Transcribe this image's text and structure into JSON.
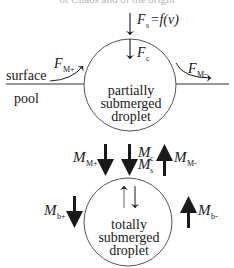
{
  "header": {
    "clipped_caption": "of Chaos and of the origin"
  },
  "top_region": {
    "surface_label": "surface",
    "pool_label": "pool",
    "droplet_label_lines": [
      "partially",
      "submerged",
      "droplet"
    ],
    "forces": {
      "surface_force": {
        "symbol": "F",
        "sub": "s",
        "suffix": "=f(v)"
      },
      "coalescence_force": {
        "symbol": "F",
        "sub": "c"
      },
      "marangoni_plus": {
        "symbol": "F",
        "sub": "M+"
      },
      "marangoni_minus": {
        "symbol": "F",
        "sub": "M-"
      }
    }
  },
  "middle_region": {
    "momenta": {
      "m_marangoni_plus": {
        "symbol": "M",
        "sub": "M+"
      },
      "m_c": {
        "symbol": "M",
        "sub": "c"
      },
      "m_s": {
        "symbol": "M",
        "sub": "s"
      },
      "m_marangoni_minus": {
        "symbol": "M",
        "sub": "M-"
      }
    }
  },
  "bottom_region": {
    "droplet_label_lines": [
      "totally",
      "submerged",
      "droplet"
    ],
    "momenta": {
      "m_b_plus": {
        "symbol": "M",
        "sub": "b+"
      },
      "m_b_minus": {
        "symbol": "M",
        "sub": "b-"
      }
    }
  },
  "colors": {
    "ink": "#1a1a1a",
    "circle_stroke": "#555555",
    "background": "#ffffff"
  }
}
